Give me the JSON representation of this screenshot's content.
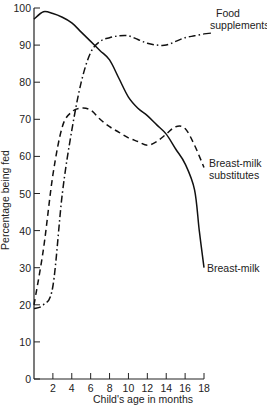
{
  "chart_data": {
    "type": "line",
    "title": "",
    "xlabel": "Child's age in months",
    "ylabel": "Percentage being fed",
    "xlim": [
      0,
      18
    ],
    "ylim": [
      0,
      100
    ],
    "x_ticks": [
      2,
      4,
      6,
      8,
      10,
      12,
      14,
      16,
      18
    ],
    "y_ticks": [
      0,
      10,
      20,
      30,
      40,
      50,
      60,
      70,
      80,
      90,
      100
    ],
    "grid": false,
    "legend": "inline labels at line ends",
    "series": [
      {
        "name": "Breast-milk",
        "style": "solid",
        "x": [
          0,
          1,
          2,
          3,
          4,
          5,
          6,
          7,
          8,
          9,
          10,
          11,
          12,
          13,
          14,
          15,
          16,
          17,
          17.5,
          18
        ],
        "values": [
          97,
          99,
          98.5,
          97.5,
          96,
          93.5,
          91,
          88.5,
          86,
          81,
          76,
          73,
          71,
          68.5,
          66,
          62,
          58,
          51,
          40,
          30
        ]
      },
      {
        "name": "Breast-milk substitutes",
        "style": "dashed",
        "x": [
          0,
          1,
          2,
          3,
          4,
          5,
          6,
          7,
          8,
          9,
          10,
          11,
          12,
          13,
          14,
          15,
          16,
          17,
          18
        ],
        "values": [
          20,
          35,
          55,
          68,
          72,
          73,
          72.5,
          70,
          68,
          66.5,
          65,
          64,
          63,
          64,
          66,
          68,
          67.5,
          63,
          57
        ]
      },
      {
        "name": "Food supplements",
        "style": "dash-dot",
        "x": [
          0,
          1,
          2,
          3,
          4,
          5,
          6,
          7,
          8,
          9,
          10,
          11,
          12,
          13,
          14,
          15,
          16,
          17,
          18
        ],
        "values": [
          19,
          20,
          25,
          50,
          67,
          80,
          88,
          91,
          92,
          92.5,
          92.5,
          91.5,
          90.5,
          90,
          90,
          91,
          92,
          92.5,
          93
        ]
      }
    ],
    "labels": {
      "food_line1": "Food",
      "food_line2": "supplements",
      "subs_line1": "Breast-milk",
      "subs_line2": "substitutes",
      "milk": "Breast-milk"
    }
  }
}
